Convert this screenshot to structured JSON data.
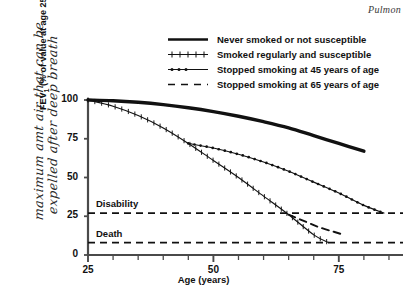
{
  "header": {
    "running_head": "Pulmon"
  },
  "annotation": {
    "handwritten_line1": "maximum amt air that can be",
    "handwritten_line2": "expelled after deep breath"
  },
  "legend": {
    "items": [
      {
        "label": "Never smoked or not susceptible",
        "style": "solid-thick",
        "marker": "none"
      },
      {
        "label": "Smoked regularly and susceptible",
        "style": "solid-thin",
        "marker": "plus"
      },
      {
        "label": "Stopped smoking at 45 years of age",
        "style": "solid-thin",
        "marker": "dot"
      },
      {
        "label": "Stopped smoking at 65 years of age",
        "style": "dashed",
        "marker": "none"
      }
    ]
  },
  "chart_data": {
    "type": "line",
    "title": "",
    "xlabel": "Age (years)",
    "ylabel": "FEV₁ (% of value at age 25)",
    "ylabel_main": "FEV",
    "ylabel_sub": "1",
    "ylabel_rest": " (% of value at age 25)",
    "xlim": [
      25,
      87
    ],
    "ylim": [
      0,
      105
    ],
    "xticks": [
      25,
      50,
      75
    ],
    "xtick_labels": [
      "25",
      "50",
      "75"
    ],
    "xminor_step": 5,
    "yticks": [
      0,
      25,
      50,
      75,
      100
    ],
    "ytick_labels": [
      "0",
      "25",
      "50",
      "75",
      "100"
    ],
    "grid": false,
    "legend_position": "top-center",
    "threshold_lines": [
      {
        "label": "Disability",
        "value": 27,
        "style": "dashed"
      },
      {
        "label": "Death",
        "value": 8,
        "style": "dashed"
      }
    ],
    "series": [
      {
        "name": "Never smoked or not susceptible",
        "style": "solid-thick",
        "marker": "none",
        "x": [
          25,
          30,
          35,
          40,
          45,
          50,
          55,
          60,
          65,
          70,
          75,
          80
        ],
        "y": [
          100,
          99.5,
          98.5,
          97,
          95,
          92.5,
          89.5,
          86,
          82,
          77,
          72,
          67
        ]
      },
      {
        "name": "Smoked regularly and susceptible",
        "style": "solid-thin",
        "marker": "plus",
        "x": [
          25,
          30,
          35,
          40,
          45,
          50,
          55,
          60,
          65,
          70,
          73
        ],
        "y": [
          100,
          96,
          90,
          82,
          72,
          61,
          50,
          38,
          26,
          13,
          8
        ]
      },
      {
        "name": "Stopped smoking at 45 years of age",
        "style": "solid-thin",
        "marker": "dot",
        "x": [
          45,
          50,
          55,
          60,
          65,
          70,
          75,
          80,
          84
        ],
        "y": [
          72,
          69,
          65,
          60,
          54,
          47,
          40,
          32,
          27
        ]
      },
      {
        "name": "Stopped smoking at 65 years of age",
        "style": "dashed",
        "marker": "none",
        "x": [
          65,
          68,
          71,
          74,
          76
        ],
        "y": [
          26,
          22,
          18,
          15,
          13
        ]
      }
    ]
  },
  "colors": {
    "ink": "#111111",
    "axis": "#4a4a4a",
    "header": "#3a3a3a"
  }
}
